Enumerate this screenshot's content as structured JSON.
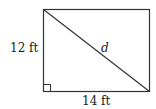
{
  "diagram": {
    "shape": "rectangle",
    "height_label": "12 ft",
    "width_label": "14 ft",
    "diagonal_label": "d",
    "right_angle_marker": true,
    "colors": {
      "stroke": "#333333",
      "background": "#ffffff"
    }
  }
}
